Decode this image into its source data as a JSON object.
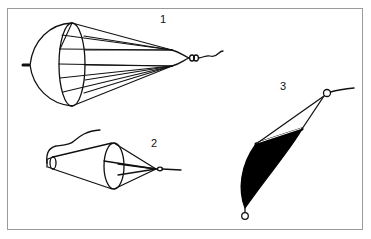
{
  "figure": {
    "type": "technical illustration",
    "labels": [
      {
        "id": "1",
        "text": "1",
        "description": "parachute-type sea anchor with multiple shroud lines converging to swivel"
      },
      {
        "id": "2",
        "text": "2",
        "description": "cone drogue with tripping line"
      },
      {
        "id": "3",
        "text": "3",
        "description": "bag/sheet drogue with shaded fabric and end rings"
      }
    ],
    "colors": {
      "line": "#111111",
      "frame": "#9a9a9a",
      "background": "#ffffff",
      "fill": "#000000"
    }
  }
}
